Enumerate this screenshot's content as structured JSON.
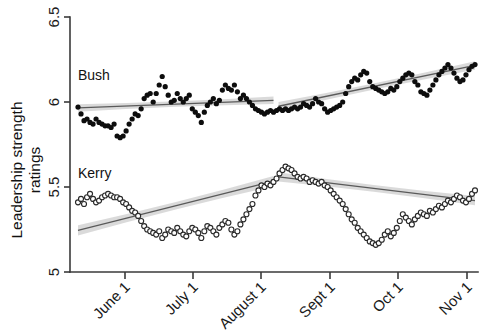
{
  "chart_data": {
    "type": "scatter",
    "title": "",
    "xlabel": "",
    "ylabel": "Leadership strength ratings",
    "ylabel_lines": [
      "Leadership strength",
      "ratings"
    ],
    "ylim": [
      5,
      6.5
    ],
    "yticks": [
      5,
      5.5,
      6,
      6.5
    ],
    "ytick_labels": [
      "5",
      "5.5",
      "6",
      "6.5"
    ],
    "xticks": [
      "June 1",
      "July 1",
      "August 1",
      "Sept 1",
      "Oct 1",
      "Nov 1"
    ],
    "xtick_rotation": -45,
    "grid": false,
    "legend": "inline-annotations",
    "annotations": [
      {
        "text": "Bush",
        "x": "mid-May",
        "y": 6.18
      },
      {
        "text": "Kerry",
        "x": "mid-May",
        "y": 5.58
      }
    ],
    "series": [
      {
        "name": "Bush",
        "marker": "filled-circle",
        "color": "#0d0d0d",
        "points_x": [
          0,
          3,
          6,
          9,
          12,
          15,
          18,
          21,
          24,
          27,
          30,
          33,
          36,
          39,
          42,
          45,
          48,
          51,
          54,
          57,
          60,
          63,
          66,
          69,
          72,
          75,
          78,
          81,
          84,
          87,
          90,
          93,
          96,
          99,
          102,
          105,
          108,
          111,
          114,
          117,
          120,
          123,
          126,
          129,
          132,
          135,
          138,
          141,
          144,
          147,
          150,
          153,
          156,
          159,
          162,
          165,
          168,
          171,
          174,
          177,
          180,
          183,
          186,
          189,
          192,
          195,
          198,
          201,
          204,
          207,
          210,
          213,
          216,
          219,
          222,
          225,
          228,
          231,
          234,
          237,
          240,
          243,
          246,
          249,
          252,
          255,
          258,
          261,
          264,
          267,
          270,
          273,
          276,
          279,
          282,
          285,
          288,
          291,
          294,
          297,
          300,
          303,
          306,
          309,
          312,
          315,
          318,
          321,
          324,
          327,
          330,
          333,
          336,
          339,
          342,
          345,
          348,
          351,
          354,
          357,
          360,
          363,
          366,
          369,
          372,
          375,
          378,
          381,
          384,
          387,
          390,
          393,
          396
        ],
        "values": [
          5.97,
          5.93,
          5.89,
          5.9,
          5.88,
          5.87,
          5.9,
          5.88,
          5.87,
          5.86,
          5.86,
          5.85,
          5.87,
          5.8,
          5.79,
          5.8,
          5.83,
          5.87,
          5.9,
          5.93,
          5.92,
          5.96,
          6.02,
          6.04,
          6.05,
          6.0,
          6.05,
          6.1,
          6.15,
          6.09,
          6.04,
          6.0,
          6.01,
          6.05,
          6.02,
          6.0,
          6.02,
          6.04,
          5.96,
          5.94,
          5.92,
          5.88,
          5.94,
          5.98,
          6.0,
          6.02,
          5.99,
          6.01,
          6.07,
          6.1,
          6.08,
          6.07,
          6.1,
          6.06,
          6.02,
          6.04,
          6.02,
          6.0,
          5.98,
          5.96,
          5.95,
          5.94,
          5.93,
          5.94,
          5.95,
          5.94,
          5.95,
          5.96,
          5.95,
          5.96,
          5.95,
          5.96,
          5.97,
          5.96,
          5.97,
          5.99,
          5.98,
          5.97,
          5.99,
          6.02,
          6.0,
          5.99,
          5.96,
          5.94,
          5.95,
          5.96,
          5.97,
          5.98,
          6.0,
          6.05,
          6.09,
          6.12,
          6.14,
          6.13,
          6.16,
          6.18,
          6.17,
          6.12,
          6.09,
          6.08,
          6.07,
          6.06,
          6.05,
          6.06,
          6.08,
          6.07,
          6.09,
          6.12,
          6.14,
          6.16,
          6.17,
          6.16,
          6.12,
          6.1,
          6.06,
          6.05,
          6.04,
          6.07,
          6.1,
          6.13,
          6.16,
          6.18,
          6.2,
          6.22,
          6.2,
          6.17,
          6.14,
          6.12,
          6.13,
          6.16,
          6.19,
          6.21,
          6.22
        ]
      },
      {
        "name": "Kerry",
        "marker": "open-circle",
        "color": "#2a2a2a",
        "points_x": [
          0,
          3,
          6,
          9,
          12,
          15,
          18,
          21,
          24,
          27,
          30,
          33,
          36,
          39,
          42,
          45,
          48,
          51,
          54,
          57,
          60,
          63,
          66,
          69,
          72,
          75,
          78,
          81,
          84,
          87,
          90,
          93,
          96,
          99,
          102,
          105,
          108,
          111,
          114,
          117,
          120,
          123,
          126,
          129,
          132,
          135,
          138,
          141,
          144,
          147,
          150,
          153,
          156,
          159,
          162,
          165,
          168,
          171,
          174,
          177,
          180,
          183,
          186,
          189,
          192,
          195,
          198,
          201,
          204,
          207,
          210,
          213,
          216,
          219,
          222,
          225,
          228,
          231,
          234,
          237,
          240,
          243,
          246,
          249,
          252,
          255,
          258,
          261,
          264,
          267,
          270,
          273,
          276,
          279,
          282,
          285,
          288,
          291,
          294,
          297,
          300,
          303,
          306,
          309,
          312,
          315,
          318,
          321,
          324,
          327,
          330,
          333,
          336,
          339,
          342,
          345,
          348,
          351,
          354,
          357,
          360,
          363,
          366,
          369,
          372,
          375,
          378,
          381,
          384,
          387,
          390,
          393,
          396
        ],
        "values": [
          5.41,
          5.43,
          5.4,
          5.44,
          5.46,
          5.43,
          5.41,
          5.42,
          5.44,
          5.45,
          5.46,
          5.45,
          5.44,
          5.44,
          5.43,
          5.41,
          5.4,
          5.38,
          5.36,
          5.35,
          5.33,
          5.3,
          5.27,
          5.25,
          5.24,
          5.23,
          5.22,
          5.24,
          5.2,
          5.22,
          5.25,
          5.24,
          5.23,
          5.26,
          5.24,
          5.22,
          5.21,
          5.24,
          5.26,
          5.25,
          5.23,
          5.2,
          5.24,
          5.27,
          5.26,
          5.24,
          5.22,
          5.26,
          5.28,
          5.3,
          5.29,
          5.25,
          5.22,
          5.24,
          5.28,
          5.31,
          5.34,
          5.37,
          5.4,
          5.45,
          5.48,
          5.51,
          5.5,
          5.52,
          5.51,
          5.53,
          5.55,
          5.58,
          5.6,
          5.62,
          5.61,
          5.6,
          5.58,
          5.56,
          5.55,
          5.56,
          5.55,
          5.53,
          5.54,
          5.53,
          5.52,
          5.53,
          5.51,
          5.5,
          5.48,
          5.46,
          5.44,
          5.42,
          5.4,
          5.37,
          5.34,
          5.31,
          5.29,
          5.26,
          5.24,
          5.22,
          5.2,
          5.18,
          5.17,
          5.16,
          5.17,
          5.19,
          5.22,
          5.24,
          5.21,
          5.23,
          5.26,
          5.3,
          5.34,
          5.32,
          5.3,
          5.28,
          5.31,
          5.33,
          5.35,
          5.34,
          5.33,
          5.36,
          5.35,
          5.37,
          5.39,
          5.38,
          5.4,
          5.42,
          5.41,
          5.43,
          5.45,
          5.44,
          5.42,
          5.41,
          5.43,
          5.46,
          5.48
        ]
      }
    ],
    "fits": [
      {
        "series": "Bush",
        "segment": "pre-August",
        "x0": 0,
        "x1": 195,
        "y0": 5.965,
        "y1": 6.01,
        "ci": 0.022
      },
      {
        "series": "Bush",
        "segment": "post-August",
        "x0": 200,
        "x1": 396,
        "y0": 5.975,
        "y1": 6.215,
        "ci": 0.025
      },
      {
        "series": "Kerry",
        "segment": "pre-August",
        "x0": 0,
        "x1": 195,
        "y0": 5.245,
        "y1": 5.535,
        "ci": 0.03
      },
      {
        "series": "Kerry",
        "segment": "post-August",
        "x0": 200,
        "x1": 396,
        "y0": 5.56,
        "y1": 5.42,
        "ci": 0.027
      }
    ]
  },
  "colors": {
    "bush_marker": "#0d0d0d",
    "kerry_marker": "#ffffff",
    "kerry_stroke": "#2a2a2a",
    "fit_line": "#5a5a5a",
    "ci_band": "#b9b9b9",
    "axis": "#3a3a3a"
  }
}
